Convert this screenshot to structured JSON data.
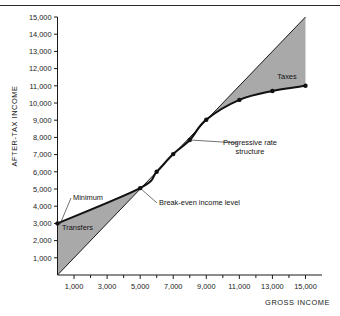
{
  "figure": {
    "domain": "chart",
    "background_color": "#ffffff",
    "has_top_rule": true
  },
  "chart_data": {
    "type": "line",
    "title": "",
    "subtitle": "",
    "xlabel": "GROSS INCOME",
    "ylabel": "AFTER-TAX INCOME",
    "xlim": [
      0,
      16000
    ],
    "ylim": [
      0,
      15000
    ],
    "grid": false,
    "legend_position": "none",
    "x_ticks": [
      1000,
      3000,
      5000,
      7000,
      9000,
      11000,
      13000,
      15000
    ],
    "x_tick_labels": [
      "1,000",
      "3,000",
      "5,000",
      "7,000",
      "9,000",
      "11,000",
      "13,000",
      "15,000"
    ],
    "x_minor_ticks": [
      2000,
      4000,
      6000,
      8000,
      10000,
      12000,
      14000
    ],
    "y_ticks": [
      1000,
      2000,
      3000,
      4000,
      5000,
      6000,
      7000,
      8000,
      9000,
      10000,
      11000,
      12000,
      13000,
      14000,
      15000
    ],
    "y_tick_labels": [
      "1,000",
      "2,000",
      "3,000",
      "4,000",
      "5,000",
      "6,000",
      "7,000",
      "8,000",
      "9,000",
      "10,000",
      "11,000",
      "12,000",
      "13,000",
      "14,000",
      "15,000"
    ],
    "series": [
      {
        "name": "45-degree reference line",
        "description": "Gross income equals after-tax income",
        "style": "thin-solid",
        "color": "#1a1a1a",
        "x": [
          0,
          15000
        ],
        "values": [
          0,
          15000
        ]
      },
      {
        "name": "Progressive rate structure",
        "description": "After-tax income under a negative income tax with a guaranteed minimum",
        "style": "thick-solid",
        "color": "#111111",
        "marker": "filled-circle",
        "x": [
          0,
          5000,
          6000,
          7000,
          8000,
          9000,
          11000,
          13000,
          15000
        ],
        "values": [
          3000,
          5050,
          6000,
          7030,
          7850,
          9030,
          10180,
          10700,
          11000
        ]
      }
    ],
    "shaded_regions": [
      {
        "name": "Transfers",
        "label": "Transfers",
        "fill": "#a9a9a9",
        "x_range": [
          0,
          5000
        ],
        "description": "Area between the progressive curve and the 45-degree line below break-even"
      },
      {
        "name": "Taxes",
        "label": "Taxes",
        "fill": "#a9a9a9",
        "x_range": [
          5000,
          15000
        ],
        "description": "Area between the 45-degree line and the progressive curve above break-even"
      }
    ],
    "annotations": [
      {
        "id": "minimum",
        "text": "Minimum",
        "points_to_x": 0,
        "points_to_y": 3000
      },
      {
        "id": "transfers",
        "text": "Transfers",
        "points_to_x": 1500,
        "points_to_y": 2400
      },
      {
        "id": "break-even",
        "text": "Break-even income level",
        "points_to_x": 5000,
        "points_to_y": 5050
      },
      {
        "id": "progressive",
        "text_line_1": "Progressive rate",
        "text_line_2": "structure",
        "points_to_x": 8000,
        "points_to_y": 7850
      },
      {
        "id": "taxes",
        "text": "Taxes",
        "points_to_x": 12500,
        "points_to_y": 12900
      }
    ],
    "key_values": {
      "guaranteed_minimum": 3000,
      "break_even_income": 5000,
      "max_plotted_gross_income": 15000,
      "after_tax_income_at_max": 11000
    }
  }
}
